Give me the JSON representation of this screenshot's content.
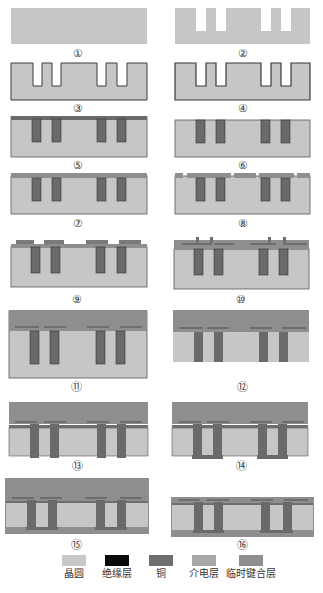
{
  "diagram": {
    "type": "process-flow",
    "steps": [
      {
        "id": 1,
        "label": "①",
        "state": "bare wafer"
      },
      {
        "id": 2,
        "label": "②",
        "state": "via etch"
      },
      {
        "id": 3,
        "label": "③",
        "state": "insulation layer deposited"
      },
      {
        "id": 4,
        "label": "④",
        "state": "barrier/seed layer"
      },
      {
        "id": 5,
        "label": "⑤",
        "state": "copper fill with overburden"
      },
      {
        "id": 6,
        "label": "⑥",
        "state": "CMP planarization"
      },
      {
        "id": 7,
        "label": "⑦",
        "state": "dielectric layer deposited"
      },
      {
        "id": 8,
        "label": "⑧",
        "state": "dielectric patterned"
      },
      {
        "id": 9,
        "label": "⑨",
        "state": "front-side metal pads"
      },
      {
        "id": 10,
        "label": "⑩",
        "state": "redistribution + dielectric"
      },
      {
        "id": 11,
        "label": "⑪",
        "state": "temporary bonding layer"
      },
      {
        "id": 12,
        "label": "⑫",
        "state": "wafer thinning"
      },
      {
        "id": 13,
        "label": "⑬",
        "state": "via reveal"
      },
      {
        "id": 14,
        "label": "⑭",
        "state": "backside bumps/RDL"
      },
      {
        "id": 15,
        "label": "⑮",
        "state": "backside dielectric"
      },
      {
        "id": 16,
        "label": "⑯",
        "state": "debond"
      }
    ]
  },
  "legend": {
    "items": [
      {
        "label": "晶圆",
        "color": "#c8c8c8"
      },
      {
        "label": "绝缘层",
        "color": "#0a0a0a"
      },
      {
        "label": "铜",
        "color": "#6e6e6e"
      },
      {
        "label": "介电层",
        "color": "#a8a8a8"
      },
      {
        "label": "临时键合层",
        "color": "#8f8f8f"
      }
    ]
  },
  "colors": {
    "wafer": "#c6c6c6",
    "insulator": "#1a1a1a",
    "copper": "#6a6a6a",
    "dielectric": "#a4a4a4",
    "bond": "#8e8e8e"
  }
}
